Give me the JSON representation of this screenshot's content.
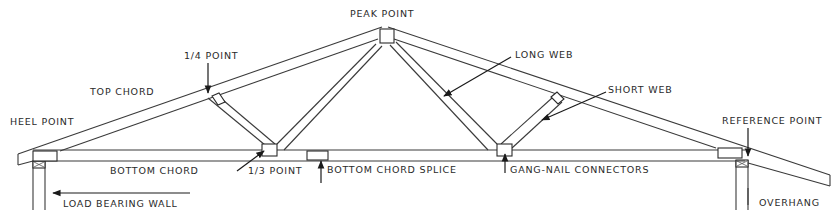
{
  "diagram": {
    "labels": {
      "peak_point": "PEAK POINT",
      "quarter_point": "1/4 POINT",
      "top_chord": "TOP CHORD",
      "heel_point": "HEEL POINT",
      "long_web": "LONG WEB",
      "short_web": "SHORT WEB",
      "reference_point": "REFERENCE POINT",
      "bottom_chord": "BOTTOM CHORD",
      "third_point": "1/3 POINT",
      "bottom_chord_splice": "BOTTOM CHORD SPLICE",
      "gang_nail_connectors": "GANG-NAIL CONNECTORS",
      "load_bearing_wall": "LOAD BEARING WALL",
      "overhang": "OVERHANG"
    },
    "colors": {
      "line": "#3a3a3a",
      "text": "#2a2a2a",
      "background": "#ffffff"
    }
  }
}
